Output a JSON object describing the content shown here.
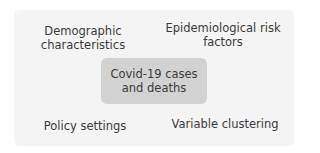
{
  "diagram": {
    "center": {
      "line1": "Covid-19 cases",
      "line2": "and deaths"
    },
    "top_left": {
      "line1": "Demographic",
      "line2": "characteristics"
    },
    "top_right": {
      "line1": "Epidemiological risk",
      "line2": "factors"
    },
    "bottom_left": {
      "line1": "Policy settings"
    },
    "bottom_right": {
      "line1": "Variable clustering"
    }
  },
  "colors": {
    "background": "#f4f4f4",
    "center_box": "#d2d2d2",
    "text": "#3a3a3a"
  }
}
